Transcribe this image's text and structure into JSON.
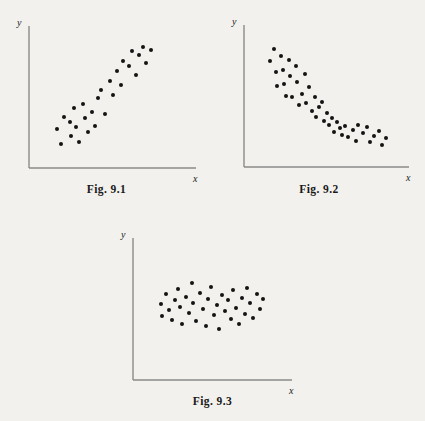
{
  "page": {
    "background_color": "#f2f1ed",
    "ink_color": "#141414",
    "axis_color": "#8a8a8a"
  },
  "figures": [
    {
      "id": "fig-9-1",
      "caption": "Fig. 9.1",
      "x_axis_label": "x",
      "y_axis_label": "y",
      "relationship": "positive-correlation",
      "frame": {
        "left": 0,
        "top": 0,
        "width": 213,
        "height": 210
      },
      "axes": {
        "origin_x": 29,
        "origin_y": 168,
        "x_end": 196,
        "y_top": 26
      },
      "caption_pos": {
        "top": 183
      },
      "chart_data": {
        "type": "scatter",
        "title": "Fig. 9.1",
        "xlabel": "x",
        "ylabel": "y",
        "grid": false,
        "legend": false,
        "xlim": [
          0,
          100
        ],
        "ylim": [
          0,
          100
        ],
        "description": "Scatter of points showing a strong positive linear association between x and y.",
        "points": [
          [
            12,
            24
          ],
          [
            15,
            12
          ],
          [
            17,
            34
          ],
          [
            21,
            30
          ],
          [
            22,
            19
          ],
          [
            24,
            41
          ],
          [
            25,
            26
          ],
          [
            27,
            14
          ],
          [
            30,
            44
          ],
          [
            31,
            33
          ],
          [
            33,
            22
          ],
          [
            36,
            38
          ],
          [
            38,
            27
          ],
          [
            40,
            49
          ],
          [
            42,
            56
          ],
          [
            45,
            36
          ],
          [
            48,
            63
          ],
          [
            50,
            52
          ],
          [
            53,
            71
          ],
          [
            56,
            60
          ],
          [
            57,
            79
          ],
          [
            61,
            75
          ],
          [
            63,
            87
          ],
          [
            66,
            68
          ],
          [
            68,
            84
          ],
          [
            71,
            90
          ],
          [
            73,
            77
          ],
          [
            76,
            88
          ]
        ]
      }
    },
    {
      "id": "fig-9-2",
      "caption": "Fig. 9.2",
      "x_axis_label": "x",
      "y_axis_label": "y",
      "relationship": "negative-curved-correlation",
      "frame": {
        "left": 213,
        "top": 0,
        "width": 212,
        "height": 210
      },
      "axes": {
        "origin_x": 31,
        "origin_y": 167,
        "x_end": 196,
        "y_top": 25
      },
      "caption_pos": {
        "top": 183
      },
      "chart_data": {
        "type": "scatter",
        "title": "Fig. 9.2",
        "xlabel": "x",
        "ylabel": "y",
        "grid": false,
        "legend": false,
        "xlim": [
          0,
          100
        ],
        "ylim": [
          0,
          100
        ],
        "description": "Scatter of points showing a strong negative, curvilinear (decaying) association between x and y.",
        "points": [
          [
            11,
            78
          ],
          [
            14,
            88
          ],
          [
            15,
            69
          ],
          [
            16,
            58
          ],
          [
            19,
            82
          ],
          [
            20,
            71
          ],
          [
            21,
            60
          ],
          [
            22,
            50
          ],
          [
            24,
            79
          ],
          [
            25,
            66
          ],
          [
            26,
            49
          ],
          [
            29,
            74
          ],
          [
            30,
            61
          ],
          [
            31,
            43
          ],
          [
            33,
            52
          ],
          [
            35,
            68
          ],
          [
            36,
            44
          ],
          [
            38,
            57
          ],
          [
            40,
            38
          ],
          [
            42,
            49
          ],
          [
            43,
            33
          ],
          [
            45,
            41
          ],
          [
            47,
            45
          ],
          [
            48,
            30
          ],
          [
            50,
            36
          ],
          [
            52,
            27
          ],
          [
            54,
            32
          ],
          [
            55,
            21
          ],
          [
            57,
            29
          ],
          [
            59,
            24
          ],
          [
            61,
            19
          ],
          [
            63,
            26
          ],
          [
            65,
            17
          ],
          [
            68,
            23
          ],
          [
            70,
            14
          ],
          [
            72,
            27
          ],
          [
            75,
            20
          ],
          [
            78,
            25
          ],
          [
            80,
            13
          ],
          [
            83,
            18
          ],
          [
            86,
            22
          ],
          [
            88,
            11
          ],
          [
            91,
            16
          ]
        ]
      }
    },
    {
      "id": "fig-9-3",
      "caption": "Fig. 9.3",
      "x_axis_label": "x",
      "y_axis_label": "y",
      "relationship": "no-correlation",
      "frame": {
        "left": 100,
        "top": 210,
        "width": 225,
        "height": 211
      },
      "axes": {
        "origin_x": 33,
        "origin_y": 170,
        "x_end": 192,
        "y_top": 28
      },
      "caption_pos": {
        "top": 185
      },
      "chart_data": {
        "type": "scatter",
        "title": "Fig. 9.3",
        "xlabel": "x",
        "ylabel": "y",
        "grid": false,
        "legend": false,
        "xlim": [
          0,
          100
        ],
        "ylim": [
          0,
          100
        ],
        "description": "Scatter of points in a horizontal band showing no association between x and y.",
        "points": [
          [
            13,
            54
          ],
          [
            14,
            44
          ],
          [
            17,
            62
          ],
          [
            19,
            49
          ],
          [
            21,
            41
          ],
          [
            23,
            57
          ],
          [
            25,
            66
          ],
          [
            27,
            52
          ],
          [
            28,
            38
          ],
          [
            31,
            60
          ],
          [
            33,
            47
          ],
          [
            35,
            71
          ],
          [
            36,
            55
          ],
          [
            38,
            40
          ],
          [
            41,
            63
          ],
          [
            43,
            50
          ],
          [
            45,
            36
          ],
          [
            47,
            58
          ],
          [
            49,
            68
          ],
          [
            51,
            45
          ],
          [
            53,
            53
          ],
          [
            55,
            34
          ],
          [
            57,
            61
          ],
          [
            59,
            48
          ],
          [
            61,
            57
          ],
          [
            63,
            42
          ],
          [
            65,
            65
          ],
          [
            67,
            51
          ],
          [
            69,
            38
          ],
          [
            71,
            59
          ],
          [
            73,
            46
          ],
          [
            75,
            67
          ],
          [
            77,
            55
          ],
          [
            79,
            43
          ],
          [
            82,
            62
          ],
          [
            84,
            50
          ],
          [
            86,
            58
          ]
        ]
      }
    }
  ]
}
